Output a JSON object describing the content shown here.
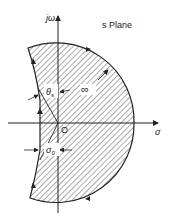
{
  "diagram": {
    "title": "s Plane",
    "axes": {
      "vertical_label": "jω",
      "horizontal_label": "σ",
      "origin_label": "O"
    },
    "annotations": {
      "angle_label": "θs",
      "angle_label_main": "θ",
      "angle_label_sub": "s",
      "radius_label": "∞",
      "offset_label": "σ0",
      "offset_label_main": "σ",
      "offset_label_sub": "0"
    },
    "colors": {
      "stroke": "#222222",
      "hatch": "#444444",
      "background": "#ffffff"
    }
  }
}
